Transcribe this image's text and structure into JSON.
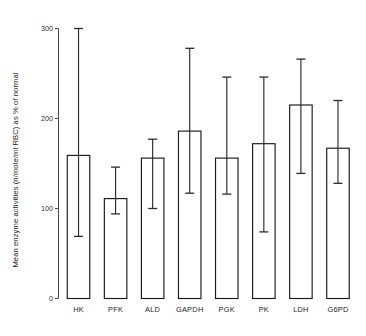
{
  "chart_data": {
    "type": "bar",
    "title": "",
    "subtitle": "",
    "xlabel": "",
    "ylabel": "Mean enzyme activities (n/mole/ml RBC) as % of normal",
    "categories": [
      "HK",
      "PFK",
      "ALD",
      "GAPDH",
      "PGK",
      "PK",
      "LDH",
      "G6PD"
    ],
    "values": [
      159,
      111,
      156,
      186,
      156,
      172,
      215,
      167
    ],
    "error_upper": [
      300,
      146,
      177,
      278,
      246,
      246,
      266,
      220
    ],
    "error_lower": [
      69,
      94,
      100,
      117,
      116,
      74,
      139,
      128
    ],
    "ylim": [
      0,
      300
    ],
    "yticks": [
      0,
      100,
      200,
      300
    ],
    "ytick_labels": [
      "0",
      "100",
      "200",
      "300"
    ],
    "grid": false,
    "legend": null,
    "legend_position": "none",
    "bar_fill_color": "#ffffff",
    "bar_edge_color": "#1a1a1a",
    "error_bar_color": "#2b2b2b",
    "axis_color": "#4a4a4a"
  }
}
